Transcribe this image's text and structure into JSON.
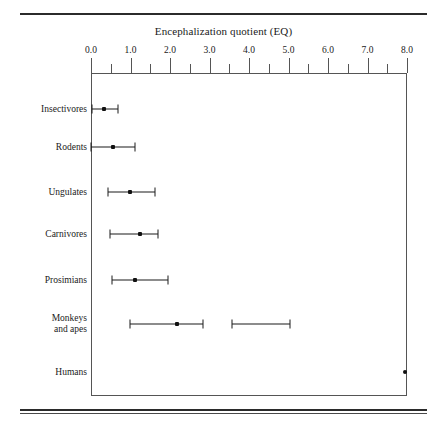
{
  "figure": {
    "title": "Encephalization quotient (EQ)"
  },
  "axis": {
    "tick_labels": [
      "0.0",
      "1.0",
      "2.0",
      "3.0",
      "4.0",
      "5.0",
      "6.0",
      "7.0",
      "8.0"
    ],
    "major_ticks": [
      0,
      1,
      2,
      3,
      4,
      5,
      6,
      7,
      8
    ],
    "minor_ticks": [
      0.5,
      1.5,
      2.5,
      3.5,
      4.5,
      5.5,
      6.5,
      7.5
    ],
    "min": 0,
    "max": 8
  },
  "categories": [
    "Insectivores",
    "Rodents",
    "Ungulates",
    "Carnivores",
    "Prosimians",
    "Monkeys\nand apes",
    "Humans"
  ],
  "chart_data": {
    "type": "scatter",
    "title": "Encephalization quotient (EQ)",
    "xlabel": "Encephalization quotient (EQ)",
    "ylabel": "",
    "xlim": [
      0,
      8
    ],
    "grid": false,
    "legend": null,
    "orientation": "horizontal",
    "categories": [
      "Insectivores",
      "Rodents",
      "Ungulates",
      "Carnivores",
      "Prosimians",
      "Monkeys and apes",
      "Humans"
    ],
    "ranges": [
      {
        "category": "Insectivores",
        "low": 0.03,
        "value": 0.33,
        "high": 0.68
      },
      {
        "category": "Rodents",
        "low": 0.0,
        "value": 0.56,
        "high": 1.11
      },
      {
        "category": "Ungulates",
        "low": 0.43,
        "value": 0.99,
        "high": 1.62
      },
      {
        "category": "Carnivores",
        "low": 0.48,
        "value": 1.24,
        "high": 1.7
      },
      {
        "category": "Prosimians",
        "low": 0.53,
        "value": 1.11,
        "high": 1.95
      },
      {
        "category": "Monkeys and apes",
        "low": 0.99,
        "value": 2.18,
        "high": 2.84
      },
      {
        "category": "Monkeys and apes",
        "low": 3.57,
        "value": null,
        "high": 5.04
      },
      {
        "category": "Humans",
        "low": null,
        "value": 7.95,
        "high": null
      }
    ]
  },
  "colors": {
    "line": "#1a1a1a",
    "frame": "#555555",
    "rule": "#2b2b2b",
    "background": "#ffffff"
  }
}
